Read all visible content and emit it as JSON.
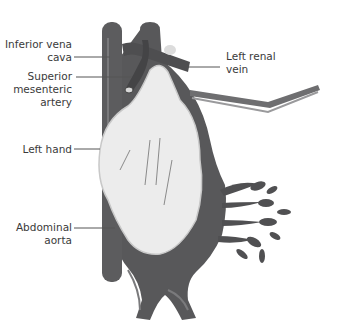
{
  "figure": {
    "type": "anatomical-illustration",
    "colors": {
      "vessel": "#58585a",
      "vessel_highlight": "#7a7a7c",
      "hand": "#ececec",
      "hand_shadow": "#c8c8c8",
      "instrument": "#6e6e70",
      "label_text": "#3a3a3a",
      "leader_line": "#555555"
    }
  },
  "labels": {
    "ivc": {
      "line1": "Inferior vena",
      "line2": "cava"
    },
    "sma": {
      "line1": "Superior",
      "line2": "mesenteric",
      "line3": "artery"
    },
    "hand": {
      "line1": "Left hand"
    },
    "aorta": {
      "line1": "Abdominal",
      "line2": "aorta"
    },
    "lrv": {
      "line1": "Left renal",
      "line2": "vein"
    }
  }
}
